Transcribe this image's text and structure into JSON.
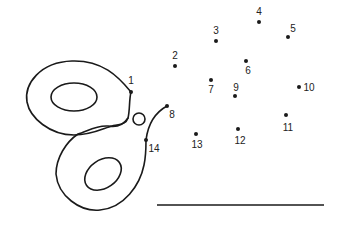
{
  "worksheet": {
    "type": "connect-the-dots",
    "subject": "butterfly",
    "colors": {
      "ink": "#1a1a1a",
      "background": "#ffffff"
    },
    "dots": [
      {
        "n": "1",
        "x": 131,
        "y": 92,
        "lx": 131,
        "ly": 84
      },
      {
        "n": "2",
        "x": 175,
        "y": 66,
        "lx": 175,
        "ly": 59
      },
      {
        "n": "3",
        "x": 216,
        "y": 41,
        "lx": 216,
        "ly": 34
      },
      {
        "n": "4",
        "x": 259,
        "y": 22,
        "lx": 259,
        "ly": 15
      },
      {
        "n": "5",
        "x": 288,
        "y": 37,
        "lx": 293,
        "ly": 32
      },
      {
        "n": "6",
        "x": 246,
        "y": 61,
        "lx": 248,
        "ly": 74
      },
      {
        "n": "7",
        "x": 211,
        "y": 80,
        "lx": 211,
        "ly": 93
      },
      {
        "n": "8",
        "x": 167,
        "y": 106,
        "lx": 172,
        "ly": 118
      },
      {
        "n": "9",
        "x": 235,
        "y": 96,
        "lx": 236,
        "ly": 91
      },
      {
        "n": "10",
        "x": 299,
        "y": 87,
        "lx": 309,
        "ly": 91
      },
      {
        "n": "11",
        "x": 286,
        "y": 115,
        "lx": 288,
        "ly": 131
      },
      {
        "n": "12",
        "x": 238,
        "y": 129,
        "lx": 240,
        "ly": 144
      },
      {
        "n": "13",
        "x": 196,
        "y": 134,
        "lx": 197,
        "ly": 148
      },
      {
        "n": "14",
        "x": 146,
        "y": 140,
        "lx": 154,
        "ly": 152
      }
    ],
    "answer_line": {
      "x1": 157,
      "x2": 324,
      "y": 205
    }
  }
}
